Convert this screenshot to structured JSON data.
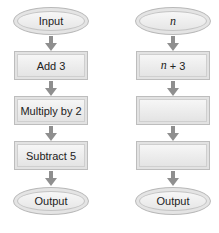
{
  "left_flowchart": {
    "start": "Input",
    "steps": [
      "Add 3",
      "Multiply by 2",
      "Subtract 5"
    ],
    "end": "Output"
  },
  "right_flowchart": {
    "start_var": "n",
    "step1_var": "n",
    "step1_op": " + 3",
    "steps": [
      "",
      ""
    ],
    "end": "Output"
  },
  "colors": {
    "arrow": "#8f8f8f",
    "shape_fill": "#ececec",
    "shape_border": "#bdbdbd"
  }
}
